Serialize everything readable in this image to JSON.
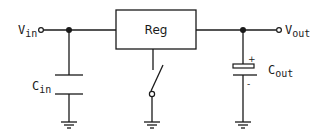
{
  "diagram": {
    "type": "circuit-schematic",
    "colors": {
      "stroke": "#1a1a1a",
      "background": "#ffffff"
    },
    "terminals": {
      "input": {
        "label_main": "V",
        "label_sub": "in"
      },
      "output": {
        "label_main": "V",
        "label_sub": "out"
      }
    },
    "components": {
      "regulator": {
        "label": "Reg"
      },
      "input_capacitor": {
        "label_main": "C",
        "label_sub": "in"
      },
      "output_capacitor": {
        "label_main": "C",
        "label_sub": "out",
        "plus": "+",
        "minus": "-"
      },
      "switch": {
        "type": "spst-open"
      }
    },
    "grounds": 3,
    "junctions": 2
  }
}
